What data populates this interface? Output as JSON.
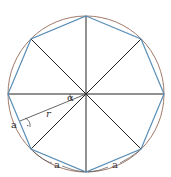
{
  "diagram": {
    "colors": {
      "circle": "#a07a6a",
      "octagon": "#5a8fb8",
      "spokes": "#222222"
    },
    "labels": {
      "angle": "α",
      "radius": "r",
      "side_left": "a",
      "side_bottom_left": "a",
      "side_bottom_right": "a",
      "right_angle_dot": "·"
    }
  }
}
